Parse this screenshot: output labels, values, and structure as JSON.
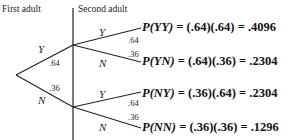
{
  "headers": {
    "first": "First adult",
    "second": "Second adult"
  },
  "first_branches": [
    {
      "label": "Y",
      "prob": ".64"
    },
    {
      "label": "N",
      "prob": ".36"
    }
  ],
  "second_branches": [
    {
      "label": "Y",
      "prob": ".64"
    },
    {
      "label": "N",
      "prob": ".36"
    },
    {
      "label": "Y",
      "prob": ".64"
    },
    {
      "label": "N",
      "prob": ".36"
    }
  ],
  "outcomes": [
    {
      "event": "P(YY)",
      "expr": "= (.64)(.64) = .4096"
    },
    {
      "event": "P(YN)",
      "expr": "= (.64)(.36) = .2304"
    },
    {
      "event": "P(NY)",
      "expr": "= (.36)(.64) = .2304"
    },
    {
      "event": "P(NN)",
      "expr": "= (.36)(.36) = .1296"
    }
  ]
}
